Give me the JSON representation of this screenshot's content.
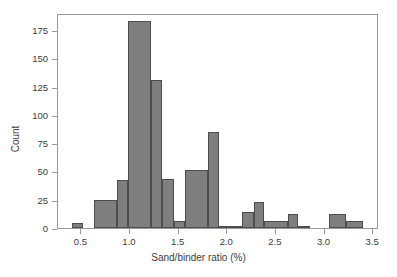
{
  "chart_data": {
    "type": "bar",
    "subtype": "histogram",
    "title": "",
    "xlabel": "Sand/binder ratio (%)",
    "ylabel": "Count",
    "xlim": [
      0.26,
      3.56
    ],
    "ylim": [
      0,
      190
    ],
    "grid": false,
    "legend": null,
    "bar_color": "#7f7f7f",
    "bar_edge_color": "#4d4d4d",
    "axis_color": "#9a9a9a",
    "bin_width": 0.1165,
    "xticks": [
      0.5,
      1.0,
      1.5,
      2.0,
      2.5,
      3.0,
      3.5
    ],
    "xtick_labels": [
      "0.5",
      "1.0",
      "1.5",
      "2.0",
      "2.5",
      "3.0",
      "3.5"
    ],
    "yticks": [
      0,
      25,
      50,
      75,
      100,
      125,
      150,
      175
    ],
    "ytick_labels": [
      "0",
      "25",
      "50",
      "75",
      "100",
      "125",
      "150",
      "175"
    ],
    "bins": [
      {
        "left": 0.4,
        "right": 0.52,
        "value": 4
      },
      {
        "left": 0.52,
        "right": 0.63,
        "value": 0
      },
      {
        "left": 0.63,
        "right": 0.75,
        "value": 25
      },
      {
        "left": 0.75,
        "right": 0.87,
        "value": 25
      },
      {
        "left": 0.87,
        "right": 0.98,
        "value": 42
      },
      {
        "left": 0.98,
        "right": 1.1,
        "value": 183
      },
      {
        "left": 1.1,
        "right": 1.22,
        "value": 183
      },
      {
        "left": 1.22,
        "right": 1.33,
        "value": 131
      },
      {
        "left": 1.33,
        "right": 1.45,
        "value": 43
      },
      {
        "left": 1.45,
        "right": 1.57,
        "value": 6
      },
      {
        "left": 1.57,
        "right": 1.68,
        "value": 51
      },
      {
        "left": 1.68,
        "right": 1.8,
        "value": 51
      },
      {
        "left": 1.8,
        "right": 1.92,
        "value": 85
      },
      {
        "left": 1.92,
        "right": 2.03,
        "value": 1
      },
      {
        "left": 2.03,
        "right": 2.15,
        "value": 1
      },
      {
        "left": 2.15,
        "right": 2.27,
        "value": 14
      },
      {
        "left": 2.27,
        "right": 2.38,
        "value": 23
      },
      {
        "left": 2.38,
        "right": 2.5,
        "value": 6
      },
      {
        "left": 2.5,
        "right": 2.62,
        "value": 6
      },
      {
        "left": 2.62,
        "right": 2.73,
        "value": 12
      },
      {
        "left": 2.73,
        "right": 2.85,
        "value": 1
      },
      {
        "left": 2.85,
        "right": 3.05,
        "value": 0
      },
      {
        "left": 3.05,
        "right": 3.22,
        "value": 12
      },
      {
        "left": 3.22,
        "right": 3.4,
        "value": 6
      }
    ],
    "bars": [
      {
        "left": 0.4,
        "right": 0.52,
        "value": 4
      },
      {
        "left": 0.63,
        "right": 0.87,
        "value": 25
      },
      {
        "left": 0.87,
        "right": 0.98,
        "value": 42
      },
      {
        "left": 0.98,
        "right": 1.22,
        "value": 183
      },
      {
        "left": 1.22,
        "right": 1.33,
        "value": 131
      },
      {
        "left": 1.33,
        "right": 1.45,
        "value": 43
      },
      {
        "left": 1.45,
        "right": 1.57,
        "value": 6
      },
      {
        "left": 1.57,
        "right": 1.8,
        "value": 51
      },
      {
        "left": 1.8,
        "right": 1.92,
        "value": 85
      },
      {
        "left": 1.92,
        "right": 2.15,
        "value": 1
      },
      {
        "left": 2.15,
        "right": 2.27,
        "value": 14
      },
      {
        "left": 2.27,
        "right": 2.38,
        "value": 23
      },
      {
        "left": 2.38,
        "right": 2.62,
        "value": 6
      },
      {
        "left": 2.62,
        "right": 2.73,
        "value": 12
      },
      {
        "left": 2.73,
        "right": 2.85,
        "value": 1
      },
      {
        "left": 3.05,
        "right": 3.22,
        "value": 12
      },
      {
        "left": 3.22,
        "right": 3.4,
        "value": 6
      }
    ]
  }
}
